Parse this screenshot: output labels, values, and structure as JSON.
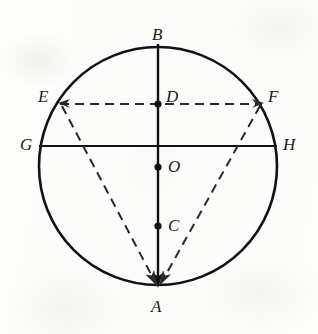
{
  "figure": {
    "kind": "geometry-diagram",
    "background_color": "#fdfdfc",
    "ink_color": "#121212",
    "canvas": {
      "width": 318,
      "height": 334
    }
  },
  "circle": {
    "name": "main-circle",
    "center_x": 158,
    "center_y": 166,
    "radius": 119,
    "stroke_width": 2.6,
    "style": "solid"
  },
  "points": [
    {
      "id": "B",
      "label": "B",
      "x": 158,
      "y": 47,
      "marker": false,
      "label_x": 152,
      "label_y": 26
    },
    {
      "id": "D",
      "label": "D",
      "x": 158,
      "y": 104,
      "marker": true,
      "label_x": 166,
      "label_y": 88
    },
    {
      "id": "O",
      "label": "O",
      "x": 158,
      "y": 167,
      "marker": true,
      "label_x": 168,
      "label_y": 158
    },
    {
      "id": "C",
      "label": "C",
      "x": 158,
      "y": 226,
      "marker": true,
      "label_x": 168,
      "label_y": 217
    },
    {
      "id": "A",
      "label": "A",
      "x": 158,
      "y": 285,
      "marker": false,
      "label_x": 151,
      "label_y": 298
    },
    {
      "id": "E",
      "label": "E",
      "x": 60,
      "y": 104,
      "marker": false,
      "label_x": 38,
      "label_y": 88
    },
    {
      "id": "F",
      "label": "F",
      "x": 262,
      "y": 104,
      "marker": false,
      "label_x": 268,
      "label_y": 88
    },
    {
      "id": "G",
      "label": "G",
      "x": 39,
      "y": 146,
      "marker": false,
      "label_x": 20,
      "label_y": 136
    },
    {
      "id": "H",
      "label": "H",
      "x": 277,
      "y": 146,
      "marker": false,
      "label_x": 283,
      "label_y": 136
    }
  ],
  "segments": [
    {
      "id": "BA",
      "from": "B",
      "to": "A",
      "style": "solid",
      "stroke_width": 2.4,
      "arrow_end": true
    },
    {
      "id": "GH",
      "from": "G",
      "to": "H",
      "style": "solid",
      "stroke_width": 2.2,
      "arrow_end": false
    },
    {
      "id": "EF",
      "from": "E",
      "to": "F",
      "style": "dashed",
      "stroke_width": 2.0,
      "arrow_end": false
    },
    {
      "id": "EA",
      "from": "E",
      "to": "A",
      "style": "dashed",
      "stroke_width": 2.0,
      "arrow_end": true
    },
    {
      "id": "FA",
      "from": "F",
      "to": "A",
      "style": "dashed",
      "stroke_width": 2.0,
      "arrow_end": true
    }
  ],
  "dash_pattern": "9 6",
  "marker_radius": 3.6
}
